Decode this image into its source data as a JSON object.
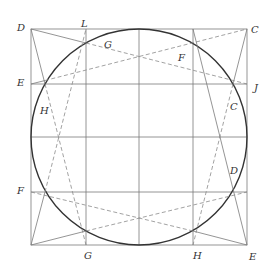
{
  "diagram": {
    "type": "geometric construction",
    "labels": {
      "D_top_left": "D",
      "L_top": "L",
      "C_top_right": "C",
      "G_top": "G",
      "F_top": "F",
      "E_left": "E",
      "J_right": "J",
      "H_left": "H",
      "C_right": "C",
      "D_right": "D",
      "F_left": "F",
      "G_bottom": "G",
      "H_bottom": "H",
      "E_bottom_right": "E"
    },
    "colors": {
      "circle": "#333333",
      "lines": "#7a7a7a",
      "labels": "#333333"
    }
  }
}
